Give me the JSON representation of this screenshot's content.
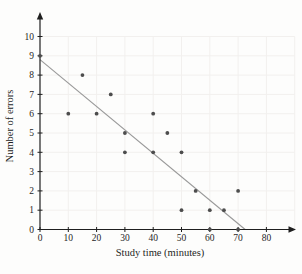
{
  "chart_data": {
    "type": "scatter",
    "title": "",
    "xlabel": "Study time (minutes)",
    "ylabel": "Number of errors",
    "xlim": [
      0,
      90
    ],
    "ylim": [
      0,
      11
    ],
    "x_ticks": [
      0,
      10,
      20,
      30,
      40,
      50,
      60,
      70,
      80
    ],
    "y_ticks": [
      0,
      1,
      2,
      3,
      4,
      5,
      6,
      7,
      8,
      9,
      10
    ],
    "grid": true,
    "series": [
      {
        "name": "observations",
        "points": [
          [
            0,
            9
          ],
          [
            10,
            6
          ],
          [
            15,
            8
          ],
          [
            20,
            6
          ],
          [
            25,
            7
          ],
          [
            30,
            5
          ],
          [
            30,
            4
          ],
          [
            40,
            6
          ],
          [
            40,
            4
          ],
          [
            45,
            5
          ],
          [
            50,
            4
          ],
          [
            50,
            1
          ],
          [
            55,
            2
          ],
          [
            60,
            1
          ],
          [
            60,
            0
          ],
          [
            65,
            1
          ],
          [
            70,
            2
          ],
          [
            70,
            0
          ]
        ]
      }
    ],
    "trend_line": {
      "x1": 0,
      "y1": 8.8,
      "x2": 72.5,
      "y2": 0
    },
    "colors": {
      "point": "#4d4d4d",
      "trend": "#999999",
      "axis": "#1f1f1f",
      "grid": "#f2f0ee",
      "text": "#1f1f1f"
    }
  }
}
